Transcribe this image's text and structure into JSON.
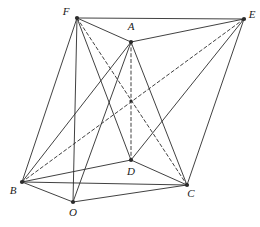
{
  "figure": {
    "type": "geometry-diagram",
    "title": "",
    "stroke_color": "#2b2b2b",
    "label_color": "#1a1a1a",
    "background": "#ffffff",
    "width": 260,
    "height": 227,
    "vertices": [
      {
        "name": "F",
        "label": "F",
        "x": 77,
        "y": 18,
        "lx": 66,
        "ly": 15,
        "dot": true
      },
      {
        "name": "A",
        "label": "A",
        "x": 131,
        "y": 42,
        "lx": 131,
        "ly": 30,
        "dot": true
      },
      {
        "name": "E",
        "label": "E",
        "x": 244,
        "y": 19,
        "lx": 252,
        "ly": 18,
        "dot": true
      },
      {
        "name": "M",
        "label": "",
        "x": 131,
        "y": 101,
        "lx": 131,
        "ly": 101,
        "dot": true
      },
      {
        "name": "D",
        "label": "D",
        "x": 131,
        "y": 160,
        "lx": 131,
        "ly": 175,
        "dot": true
      },
      {
        "name": "B",
        "label": "B",
        "x": 22,
        "y": 182,
        "lx": 13,
        "ly": 194,
        "dot": true
      },
      {
        "name": "C",
        "label": "C",
        "x": 187,
        "y": 185,
        "lx": 191,
        "ly": 197,
        "dot": true
      },
      {
        "name": "O",
        "label": "O",
        "x": 73,
        "y": 202,
        "lx": 73,
        "ly": 216,
        "dot": true
      }
    ],
    "edges": [
      {
        "name": "F-A",
        "from": "F",
        "to": "A",
        "style": "solid"
      },
      {
        "name": "A-E",
        "from": "A",
        "to": "E",
        "style": "solid"
      },
      {
        "name": "F-E",
        "from": "F",
        "to": "E",
        "style": "solid"
      },
      {
        "name": "F-B",
        "from": "F",
        "to": "B",
        "style": "solid"
      },
      {
        "name": "F-D",
        "from": "F",
        "to": "D",
        "style": "solid"
      },
      {
        "name": "F-O",
        "from": "F",
        "to": "O",
        "style": "solid"
      },
      {
        "name": "F-C",
        "from": "F",
        "to": "C",
        "style": "dashed"
      },
      {
        "name": "E-B",
        "from": "E",
        "to": "B",
        "style": "dashed"
      },
      {
        "name": "E-D",
        "from": "E",
        "to": "D",
        "style": "solid"
      },
      {
        "name": "E-C",
        "from": "E",
        "to": "C",
        "style": "solid"
      },
      {
        "name": "A-B",
        "from": "A",
        "to": "B",
        "style": "solid"
      },
      {
        "name": "A-C",
        "from": "A",
        "to": "C",
        "style": "solid"
      },
      {
        "name": "A-D",
        "from": "A",
        "to": "D",
        "style": "dashed"
      },
      {
        "name": "A-O",
        "from": "A",
        "to": "O",
        "style": "solid"
      },
      {
        "name": "B-D",
        "from": "B",
        "to": "D",
        "style": "solid"
      },
      {
        "name": "B-C",
        "from": "B",
        "to": "C",
        "style": "solid"
      },
      {
        "name": "B-O",
        "from": "B",
        "to": "O",
        "style": "solid"
      },
      {
        "name": "D-C",
        "from": "D",
        "to": "C",
        "style": "solid"
      },
      {
        "name": "O-C",
        "from": "O",
        "to": "C",
        "style": "solid"
      }
    ]
  }
}
